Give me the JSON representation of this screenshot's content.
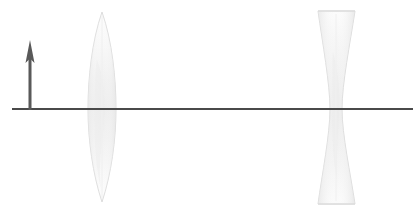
{
  "canvas": {
    "width": 419,
    "height": 212,
    "background_color": "#ffffff",
    "title": "Ray diagram: biconvex lens and biconcave lens on a common optical axis"
  },
  "colors": {
    "axis_stroke": "#4a4a4a",
    "arrow_fill": "#595959",
    "lens_outline": "#d9d9d9",
    "lens_fill_light": "#fbfbfb",
    "lens_fill_mid": "#f1f1f1",
    "lens_fill_shade": "#e8e8e8",
    "background": "#ffffff"
  },
  "optical_axis": {
    "label": "optical axis",
    "x_start": 12,
    "x_end": 413,
    "y": 109,
    "thickness": 2,
    "color": "#4a4a4a"
  },
  "object_arrow": {
    "label": "object arrow",
    "x": 30,
    "tip_y": 40,
    "base_y": 110,
    "head_width": 9,
    "head_height": 23,
    "shaft_width": 3,
    "color": "#595959",
    "direction": "up"
  },
  "lenses": [
    {
      "id": "convex-lens",
      "label": "biconvex converging lens",
      "type": "biconvex",
      "center_x": 102,
      "half_width_at_axis": 14,
      "top_y": 12,
      "bottom_y": 202,
      "axis_left_x": 88,
      "axis_right_x": 116,
      "fill": "#f3f3f3",
      "outline": "#dcdcdc"
    },
    {
      "id": "concave-lens",
      "label": "biconcave diverging lens",
      "type": "biconcave",
      "center_x": 336,
      "top_y": 11,
      "bottom_y": 204,
      "flange_left_x": 318,
      "flange_right_x": 355,
      "waist_left_x": 330,
      "waist_right_x": 342,
      "waist_y": 109,
      "fill": "#f3f3f3",
      "outline": "#dcdcdc"
    }
  ],
  "annotations": {
    "none_visible": "",
    "caption": ""
  }
}
